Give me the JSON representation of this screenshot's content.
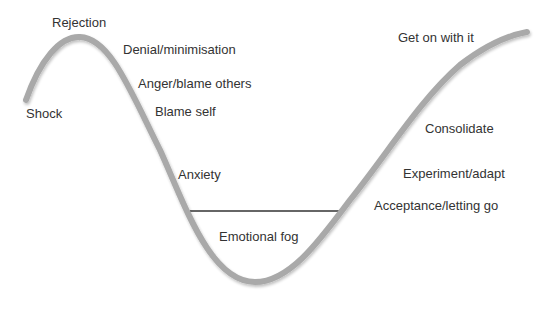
{
  "diagram": {
    "curve_color": "#a9a9a9",
    "axis_color": "#8a8a8a",
    "fog_line_color": "#333333",
    "labels": {
      "shock": "Shock",
      "rejection": "Rejection",
      "denial": "Denial/minimisation",
      "anger": "Anger/blame others",
      "blame_self": "Blame self",
      "anxiety": "Anxiety",
      "emotional_fog": "Emotional fog",
      "acceptance": "Acceptance/letting go",
      "experiment": "Experiment/adapt",
      "consolidate": "Consolidate",
      "get_on": "Get on with it"
    }
  }
}
